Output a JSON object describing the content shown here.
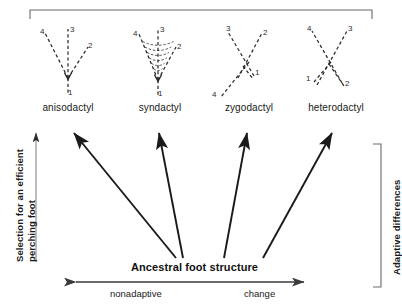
{
  "figure": {
    "top_bracket": "top-span-bracket",
    "feet": [
      {
        "name": "anisodactyl",
        "label": "anisodactyl",
        "toes": [
          {
            "num": "1",
            "dir": "down"
          },
          {
            "num": "2",
            "dir": "upper-right"
          },
          {
            "num": "3",
            "dir": "up"
          },
          {
            "num": "4",
            "dir": "upper-left"
          }
        ],
        "webbed": false
      },
      {
        "name": "syndactyl",
        "label": "syndactyl",
        "toes": [
          {
            "num": "1",
            "dir": "down"
          },
          {
            "num": "2",
            "dir": "upper-right"
          },
          {
            "num": "3",
            "dir": "up"
          },
          {
            "num": "4",
            "dir": "upper-left"
          }
        ],
        "webbed": true
      },
      {
        "name": "zygodactyl",
        "label": "zygodactyl",
        "toes": [
          {
            "num": "1",
            "dir": "lower-right"
          },
          {
            "num": "2",
            "dir": "upper-right"
          },
          {
            "num": "3",
            "dir": "upper-left"
          },
          {
            "num": "4",
            "dir": "lower-left"
          }
        ],
        "webbed": false
      },
      {
        "name": "heterodactyl",
        "label": "heterodactyl",
        "toes": [
          {
            "num": "1",
            "dir": "lower-left"
          },
          {
            "num": "2",
            "dir": "lower-right"
          },
          {
            "num": "3",
            "dir": "upper-right"
          },
          {
            "num": "4",
            "dir": "upper-left"
          }
        ],
        "webbed": false
      }
    ],
    "y_axis": {
      "label_line1": "Selection for an efficient",
      "label_line2": "perching foot"
    },
    "right_bracket": {
      "label": "Adaptive differences"
    },
    "x_axis": {
      "title": "Ancestral foot structure",
      "left_label": "nonadaptive",
      "right_label": "change"
    },
    "colors": {
      "ink": "#1a1a1a",
      "dashed": "#2b2b2b",
      "rule": "#6a6a6a",
      "background": "#ffffff"
    }
  }
}
